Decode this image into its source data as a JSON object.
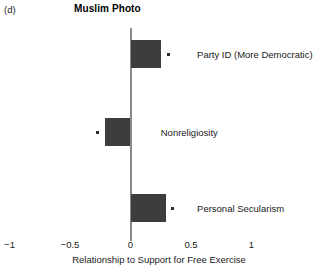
{
  "panel": {
    "letter": "(d)",
    "title": "Muslim Photo"
  },
  "chart_data": {
    "type": "bar",
    "orientation": "horizontal",
    "title": "Muslim Photo",
    "panel_label": "(d)",
    "xlabel": "Relationship to Support for Free Exercise",
    "ylabel": "",
    "xlim": [
      -1,
      1
    ],
    "xticks": [
      -1,
      -0.5,
      0,
      0.5,
      1
    ],
    "xticklabels": [
      "−1",
      "−0.5",
      "0",
      "0.5",
      "1"
    ],
    "grid": false,
    "legend": null,
    "zero_reference_line": 0,
    "bar_color": "#3d3d3d",
    "marker_color": "#2b2b2b",
    "categories": [
      "Party ID (More Democratic)",
      "Nonreligiosity",
      "Personal Secularism"
    ],
    "values": [
      0.25,
      -0.21,
      0.29
    ],
    "markers": [
      0.31,
      -0.27,
      0.35
    ],
    "bars": [
      {
        "label": "Party ID (More Democratic)",
        "value": 0.25,
        "marker": 0.31,
        "label_x": 0.55
      },
      {
        "label": "Nonreligiosity",
        "value": -0.21,
        "marker": -0.27,
        "label_x": 0.25
      },
      {
        "label": "Personal Secularism",
        "value": 0.29,
        "marker": 0.35,
        "label_x": 0.55
      }
    ]
  },
  "axis": {
    "tick_labels": [
      "−1",
      "−0.5",
      "0",
      "0.5",
      "1"
    ],
    "title": "Relationship to Support for Free Exercise"
  }
}
